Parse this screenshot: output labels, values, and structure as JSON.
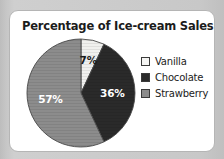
{
  "chart_data": {
    "type": "pie",
    "title": "Percentage of Ice-cream Sales",
    "xlabel": "",
    "ylabel": "",
    "legend_position": "right",
    "grid": false,
    "categories": [
      "Vanilla",
      "Chocolate",
      "Strawberry"
    ],
    "values": [
      7,
      36,
      57
    ],
    "value_labels": [
      "7%",
      "36%",
      "57%"
    ],
    "colors": [
      "#f0f0ee",
      "#2a2a2a",
      "#8c8c8c"
    ],
    "slices": [
      {
        "name": "Vanilla",
        "value": 7,
        "label": "7%",
        "color": "#f0f0ee",
        "label_color": "#1c1c1c"
      },
      {
        "name": "Chocolate",
        "value": 36,
        "label": "36%",
        "color": "#2a2a2a",
        "label_color": "#ffffff"
      },
      {
        "name": "Strawberry",
        "value": 57,
        "label": "57%",
        "color": "#8c8c8c",
        "label_color": "#ffffff"
      }
    ]
  },
  "legend": {
    "items": [
      {
        "label": "Vanilla",
        "color": "#f5f5f3"
      },
      {
        "label": "Chocolate",
        "color": "#2a2a2a"
      },
      {
        "label": "Strawberry",
        "color": "#8c8c8c"
      }
    ]
  },
  "theme": {
    "panel_background": "#ffffff",
    "panel_border": "#b5b5b5",
    "page_background": "#c9c9c9",
    "text_color": "#1c1c1c"
  }
}
